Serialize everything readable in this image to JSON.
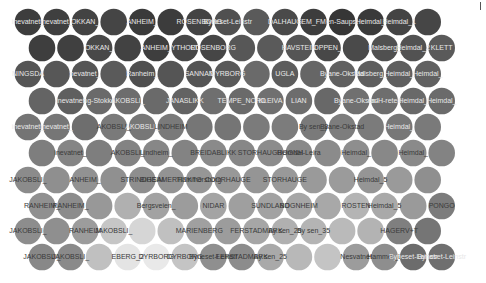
{
  "chart_data": {
    "type": "heatmap",
    "title": "",
    "xlabel": "",
    "ylabel": "",
    "layout": "hexagonal-packed circle grid",
    "grid": false,
    "legend": "none",
    "radius": 13.3,
    "x_step": 28.55,
    "row_y": [
      22,
      48,
      74,
      101,
      127,
      153,
      180,
      206,
      231,
      257
    ],
    "row_offset_start": [
      28,
      42,
      28,
      42,
      28,
      42,
      28,
      42,
      28,
      42
    ],
    "rows": [
      {
        "shades": [
          "#3d3d3d",
          "#3f3f3f",
          "#434343",
          "#454545",
          "#3a3a3a",
          "#3c3c3c",
          "#434343",
          "#505050",
          "#5a5a5a",
          "#4a4a4a",
          "#3d3d3d",
          "#363636",
          "#3a3a3a",
          "#444444",
          "#464646"
        ],
        "labels": [
          "inevatnet_",
          "inevatnet_",
          "OKKAN_",
          "",
          "ANHEIM_",
          "",
          "ROSENBORG",
          "Byneset-Leinstr",
          "",
          "DALHAUG",
          "EM_FM",
          "en-Saupst",
          "Heimdal_",
          "Heimdal_1",
          ""
        ]
      },
      {
        "shades": [
          "#3e3e3e",
          "#404040",
          "#484848",
          "#424242",
          "#3e3e3e",
          "#474747",
          "#464646",
          "#575757",
          "#5a5a5a",
          "#555555",
          "#484848",
          "#4a4a4a",
          "#505050",
          "#525252",
          "#5a5a5a"
        ],
        "labels": [
          "",
          "",
          "OKKAN_",
          "",
          "ANHEIM_",
          "YTHOLT",
          "ROSENBORG",
          "",
          "",
          "HAVSTEIN",
          "OPPEN_",
          "",
          "Malsberg_",
          "Heimdal_2",
          "KLETT"
        ]
      },
      {
        "shades": [
          "#555555",
          "#575757",
          "#555555",
          "#5a5a5a",
          "#4f4f4f",
          "#555555",
          "#545454",
          "#595959",
          "#6a6a6a",
          "#5c5c5c",
          "#666666",
          "#606060",
          "#5e5e5e",
          "#5f5f5f",
          "#616161"
        ],
        "labels": [
          "NINGSDA",
          "",
          "nevatnet_",
          "",
          "Ranheim_",
          "",
          "SANNAN",
          "DYRBORG",
          "",
          "UGLA",
          "",
          "Byane-Okstad",
          "Malsberg_",
          "Heimdal_",
          "Heimdal_"
        ]
      },
      {
        "shades": [
          "#646464",
          "#5f5f5f",
          "#6a6a6a",
          "#6d6d6d",
          "#6a6a6a",
          "#636363",
          "#6f6f6f",
          "#6a6a6a",
          "#707070",
          "#6d6d6d",
          "#686868",
          "#707070",
          "#6e6e6e",
          "#696969",
          "#6b6b6b"
        ],
        "labels": [
          "",
          "inevatnet",
          "ng-Stokke",
          "AKOBSLI_",
          "",
          "JANASLIKK",
          "",
          "TEMPE_NORD",
          "KLEIVA",
          "LIAN",
          "",
          "Byane-Okstad",
          "en-H-reted",
          "Heimdal_",
          "Heimdal_"
        ]
      },
      {
        "shades": [
          "#747474",
          "#767676",
          "#6e6e6e",
          "#7a7a7a",
          "#777777",
          "#7a7a7a",
          "#767676",
          "#757575",
          "#7b7b7b",
          "#7c7c7c",
          "#7a7a7a",
          "#7d7d7d",
          "#7b7b7b",
          "#777777",
          "#7a7a7a"
        ],
        "labels": [
          "inevatnet_",
          "inevatnet_",
          "",
          "AKOBSLI_",
          "AKOBSLI_",
          "LINDHEIM",
          "",
          "",
          "",
          "",
          "By sen_3",
          "Byane-Okstad",
          "",
          "Heimdal_",
          ""
        ]
      },
      {
        "shades": [
          "#7e7e7e",
          "#858585",
          "#7e7e7e",
          "#838383",
          "#878787",
          "#838383",
          "#8a8a8a",
          "#878787",
          "#8c8c8c",
          "#898989",
          "#8b8b8b",
          "#8e8e8e",
          "#888888",
          "#8a8a8a",
          "#838383"
        ],
        "labels": [
          "",
          "inevatnet_",
          "",
          "AKOBSLI_",
          "Lindheim_",
          "",
          "BREIDABLIKK",
          "",
          "STORHAUGBOGNH",
          "Heimdal-Leira",
          "",
          "Heimdal_",
          "",
          "Heimdal_",
          ""
        ]
      },
      {
        "shades": [
          "#8b8b8b",
          "#8f8f8f",
          "#929292",
          "#909090",
          "#8e8e8e",
          "#939393",
          "#969696",
          "#989898",
          "#959595",
          "#999999",
          "#9a9a9a",
          "#9b9b9b",
          "#959595",
          "#9a9a9a",
          "#8f8f8f"
        ],
        "labels": [
          "JAKOBSLI_",
          "",
          "ANHEIM_",
          "",
          "STRINDHEIM",
          "BIGSAMERTITKTO",
          "Hammersborg",
          "COORHAUGE",
          "",
          "STORHAUGE",
          "",
          "",
          "Heimdal_5",
          "",
          ""
        ]
      },
      {
        "shades": [
          "#909090",
          "#8c8c8c",
          "#989898",
          "#b0b0b0",
          "#a2a2a2",
          "#9c9c9c",
          "#a4a4a4",
          "#9f9f9f",
          "#a2a2a2",
          "#a6a6a6",
          "#a8a8a8",
          "#b4b4b4",
          "#a9a9a9",
          "#9a9a9a",
          "#7c7c7c"
        ],
        "labels": [
          "RANHEIM_",
          "RANHEIM_",
          "",
          "",
          "Bergsveien_",
          "",
          "NIDAR",
          "",
          "SUNDLAND",
          "BOGNHEIM",
          "",
          "ROSTEN",
          "Heimdal_5",
          "",
          "PONGO"
        ]
      },
      {
        "shades": [
          "#8d8d8d",
          "#8f8f8f",
          "#9c9c9c",
          "#c6c6c6",
          "#d6d6d6",
          "#c0c0c0",
          "#a0a0a0",
          "#9c9c9c",
          "#a6a6a6",
          "#b0b0b0",
          "#b4b4b4",
          "#bababa",
          "#b3b3b3",
          "#7f7f7f",
          "#757575"
        ],
        "labels": [
          "JAKOBSLI_",
          "",
          "RANHEIM",
          "JAKOBSLI_",
          "",
          "",
          "MARIENBERG",
          "",
          "FERSTADMARK",
          "By sen_25",
          "By sen_35",
          "",
          "",
          "HAGERV+T",
          ""
        ]
      },
      {
        "shades": [
          "#888888",
          "#8a8a8a",
          "#c0c0c0",
          "#e4e4e4",
          "#e9e9e9",
          "#c4c4c4",
          "#8f8f8f",
          "#8c8c8c",
          "#a9a9a9",
          "#b8b8b8",
          "#c4c4c4",
          "#9c9c9c",
          "#8e8e8e",
          "#6c6c6c",
          "#6f6f6f"
        ],
        "labels": [
          "JAKOBSLI_",
          "JAKOBSLI_",
          "",
          "EBERG_2",
          "DYRBORG",
          "DYRBORG",
          "Byneset-Leinstr",
          "FERSTADMARK",
          "By sen_25",
          "",
          "",
          "Nesvatnet",
          "Hammer_L",
          "Byneset-Leinstr",
          "Byneset-Leinstr"
        ]
      }
    ]
  }
}
